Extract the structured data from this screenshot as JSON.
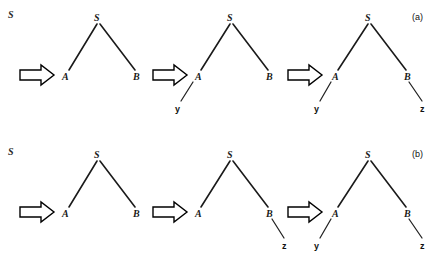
{
  "figure": {
    "background": "#ffffff",
    "ink_color": "#1a1a1a",
    "rows": [
      {
        "id": "row-a",
        "caption": "(a)",
        "start_symbol": "S",
        "stages": [
          {
            "index": 1,
            "nodes": [
              {
                "id": "S",
                "label": "S"
              },
              {
                "id": "A",
                "label": "A"
              },
              {
                "id": "B",
                "label": "B"
              }
            ],
            "terminals": []
          },
          {
            "index": 2,
            "nodes": [
              {
                "id": "S",
                "label": "S"
              },
              {
                "id": "A",
                "label": "A"
              },
              {
                "id": "B",
                "label": "B"
              }
            ],
            "terminals": [
              {
                "id": "y",
                "label": "y",
                "parent": "A"
              }
            ]
          },
          {
            "index": 3,
            "nodes": [
              {
                "id": "S",
                "label": "S"
              },
              {
                "id": "A",
                "label": "A"
              },
              {
                "id": "B",
                "label": "B"
              }
            ],
            "terminals": [
              {
                "id": "y",
                "label": "y",
                "parent": "A"
              },
              {
                "id": "z",
                "label": "z",
                "parent": "B"
              }
            ]
          }
        ],
        "arrows": [
          "arrow-right",
          "arrow-right",
          "arrow-right"
        ]
      },
      {
        "id": "row-b",
        "caption": "(b)",
        "start_symbol": "S",
        "stages": [
          {
            "index": 1,
            "nodes": [
              {
                "id": "S",
                "label": "S"
              },
              {
                "id": "A",
                "label": "A"
              },
              {
                "id": "B",
                "label": "B"
              }
            ],
            "terminals": []
          },
          {
            "index": 2,
            "nodes": [
              {
                "id": "S",
                "label": "S"
              },
              {
                "id": "A",
                "label": "A"
              },
              {
                "id": "B",
                "label": "B"
              }
            ],
            "terminals": [
              {
                "id": "z",
                "label": "z",
                "parent": "B"
              }
            ]
          },
          {
            "index": 3,
            "nodes": [
              {
                "id": "S",
                "label": "S"
              },
              {
                "id": "A",
                "label": "A"
              },
              {
                "id": "B",
                "label": "B"
              }
            ],
            "terminals": [
              {
                "id": "y",
                "label": "y",
                "parent": "A"
              },
              {
                "id": "z",
                "label": "z",
                "parent": "B"
              }
            ]
          }
        ],
        "arrows": [
          "arrow-right",
          "arrow-right",
          "arrow-right"
        ]
      }
    ]
  },
  "labels": {
    "row_a_start": "S",
    "row_b_start": "S",
    "caption_a": "(a)",
    "caption_b": "(b)",
    "a_S1": "S",
    "a_A1": "A",
    "a_B1": "B",
    "a_S2": "S",
    "a_A2": "A",
    "a_B2": "B",
    "a_y2": "y",
    "a_S3": "S",
    "a_A3": "A",
    "a_B3": "B",
    "a_y3": "y",
    "a_z3": "z",
    "b_S1": "S",
    "b_A1": "A",
    "b_B1": "B",
    "b_S2": "S",
    "b_A2": "A",
    "b_B2": "B",
    "b_z2": "z",
    "b_S3": "S",
    "b_A3": "A",
    "b_B3": "B",
    "b_y3": "y",
    "b_z3": "z"
  }
}
